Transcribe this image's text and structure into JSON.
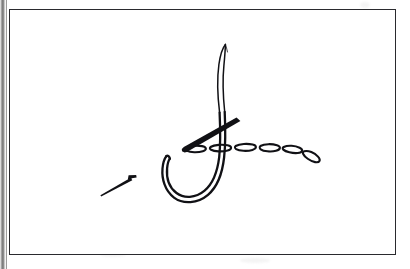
{
  "page": {
    "width": 410,
    "height": 269,
    "background_color": "#ffffff",
    "ink_color": "#111115",
    "media": "scanned book page line drawing",
    "caption": "",
    "page_number": ""
  },
  "gutter": {
    "label": "book-gutter-shadow",
    "color": "#6f6f6f"
  },
  "frame": {
    "label": "illustration-border",
    "border_color": "#2a2a2e",
    "x": 9,
    "y": 9,
    "width": 387,
    "height": 246
  },
  "illustration": {
    "title": "Chain stitch being worked with a curved needle",
    "elements": [
      {
        "name": "curved-needle",
        "label": "Curved needle",
        "description": "large hollow J-shaped curved needle, hook opening to the left"
      },
      {
        "name": "thread",
        "label": "Thread",
        "description": "fine tapering thread rising from the needle eye to upper area"
      },
      {
        "name": "chain-stitch-row",
        "label": "Chain stitch row",
        "description": "row of elongated oval loops running to the right and dipping down",
        "loop_count": 6
      },
      {
        "name": "straight-needle-thick",
        "label": "Second straight needle",
        "description": "thick tapered diagonal needle crossing the curved needle"
      },
      {
        "name": "pin",
        "label": "Small pin",
        "description": "small thin pin with a head, lying at lower left"
      }
    ]
  }
}
